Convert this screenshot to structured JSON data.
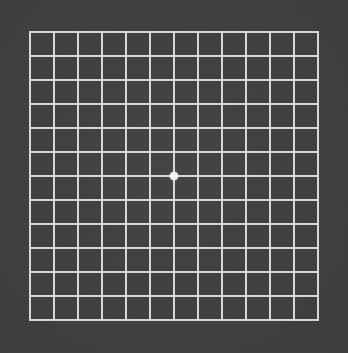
{
  "chart": {
    "title": "Amsler Grid",
    "type": "amsler-grid",
    "caption": "Amsler grid vision test chart",
    "background_color": "#3d3d3d",
    "line_color": "#d9d9d9",
    "dot_color": "#f2f2f2",
    "columns": 12,
    "rows": 12,
    "cell_size_px": 24,
    "line_width_px": 2,
    "grid_left_px": 29,
    "grid_top_px": 31,
    "grid_width_px": 290,
    "grid_height_px": 290,
    "fixation_dot": {
      "label": "central fixation dot",
      "center_x_px": 174,
      "center_y_px": 176,
      "diameter_px": 8
    }
  },
  "chart_data": {
    "type": "table",
    "title": "Amsler Grid",
    "subtitle": "",
    "xlabel": "",
    "ylabel": "",
    "grid": true,
    "legend": "none",
    "columns": 12,
    "rows": 12,
    "vertical_line_count": 13,
    "horizontal_line_count": 13,
    "cell_size_px": 24,
    "x": [
      29,
      53,
      77,
      101,
      125,
      149,
      173,
      197,
      221,
      245,
      269,
      293,
      317
    ],
    "y": [
      31,
      55,
      79,
      103,
      127,
      151,
      175,
      199,
      223,
      247,
      271,
      295,
      319
    ],
    "annotations": [
      {
        "name": "fixation-dot",
        "text": "",
        "x": 174,
        "y": 176
      }
    ],
    "colors": {
      "background": "#3d3d3d",
      "lines": "#d9d9d9",
      "dot": "#f2f2f2"
    }
  }
}
